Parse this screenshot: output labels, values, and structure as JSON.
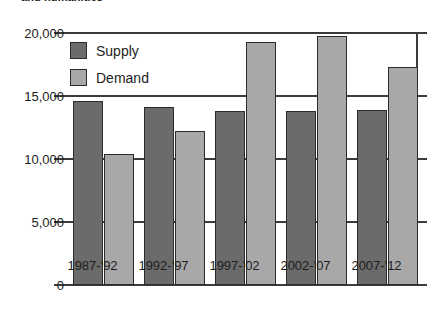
{
  "chart_data": {
    "type": "bar",
    "title": "and humanities",
    "xlabel": "",
    "ylabel": "",
    "ylim": [
      0,
      20000
    ],
    "yticks": [
      0,
      5000,
      10000,
      15000,
      20000
    ],
    "ytick_labels": [
      "0",
      "5,000",
      "10,000",
      "15,000",
      "20,000"
    ],
    "categories": [
      "1987-'92",
      "1992-'97",
      "1997-'02",
      "2002-'07",
      "2007-'12"
    ],
    "grid": true,
    "legend_position": "top-left",
    "series": [
      {
        "name": "Supply",
        "color": "#6b6b6b",
        "values": [
          14600,
          14100,
          13800,
          13850,
          13900
        ]
      },
      {
        "name": "Demand",
        "color": "#a8a8a8",
        "values": [
          10400,
          12200,
          19300,
          19800,
          17300
        ]
      }
    ]
  },
  "legend": {
    "items": [
      {
        "label": "Supply",
        "swatch": "supply"
      },
      {
        "label": "Demand",
        "swatch": "demand"
      }
    ]
  }
}
